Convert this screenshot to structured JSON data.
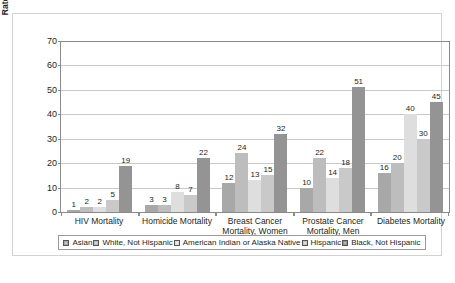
{
  "chart_data": {
    "type": "bar",
    "title": "",
    "xlabel": "",
    "ylabel": "Rate Per 100,000 Population",
    "ylim": [
      0,
      70
    ],
    "yticks": [
      0,
      10,
      20,
      30,
      40,
      50,
      60,
      70
    ],
    "grid": true,
    "legend_position": "bottom",
    "categories": [
      "HIV Mortality",
      "Homicide Mortality",
      "Breast Cancer Mortality, Women",
      "Prostate Cancer Mortality, Men",
      "Diabetes Mortality"
    ],
    "category_lines": [
      [
        "HIV Mortality"
      ],
      [
        "Homicide Mortality"
      ],
      [
        "Breast Cancer",
        "Mortality, Women"
      ],
      [
        "Prostate Cancer",
        "Mortality, Men"
      ],
      [
        "Diabetes Mortality"
      ]
    ],
    "series": [
      {
        "name": "Asian",
        "color": "#a8a8a8",
        "values": [
          1,
          3,
          12,
          10,
          16
        ]
      },
      {
        "name": "White, Not Hispanic",
        "color": "#bdbdbd",
        "values": [
          2,
          3,
          24,
          22,
          20
        ]
      },
      {
        "name": "American Indian or Alaska Native",
        "color": "#dedede",
        "values": [
          2,
          8,
          13,
          14,
          40
        ]
      },
      {
        "name": "Hispanic",
        "color": "#c9c9c9",
        "values": [
          5,
          7,
          15,
          18,
          30
        ]
      },
      {
        "name": "Black, Not Hispanic",
        "color": "#949494",
        "values": [
          19,
          22,
          32,
          51,
          45
        ]
      }
    ]
  }
}
